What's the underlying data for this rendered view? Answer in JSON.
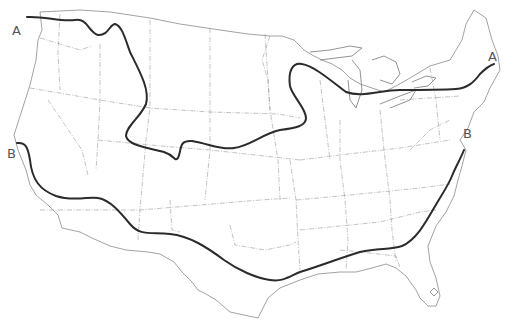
{
  "map": {
    "title": "",
    "region": "Contiguous United States",
    "labels": {
      "a_west": "A",
      "a_east": "A",
      "b_west": "B",
      "b_east": "B"
    },
    "lines": [
      {
        "id": "A",
        "description": "Northern boundary line from Washington through Montana, dipping to Colorado/Kansas, rising through Iowa/Wisconsin and east across Michigan to Maine"
      },
      {
        "id": "B",
        "description": "Southern boundary line from northern California through Arizona, New Mexico, Texas, Gulf states and up the Atlantic coast to Virginia"
      }
    ],
    "colors": {
      "line": "#2b2b2b",
      "state_border": "#9a9a9a",
      "background": "#ffffff"
    }
  }
}
